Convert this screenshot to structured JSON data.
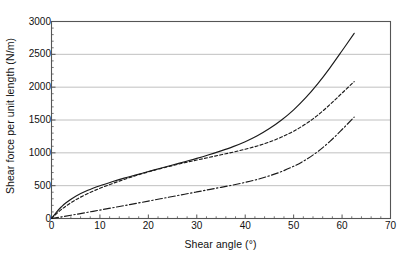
{
  "chart_data": {
    "type": "line",
    "title": "",
    "xlabel": "Shear angle (°)",
    "ylabel": "Shear force per unit length (N/m)",
    "xlim": [
      0,
      70
    ],
    "ylim": [
      0,
      3000
    ],
    "xticks": [
      0,
      10,
      20,
      30,
      40,
      50,
      60,
      70
    ],
    "yticks": [
      0,
      500,
      1000,
      1500,
      2000,
      2500,
      3000
    ],
    "xtick_labels": [
      "0",
      "10",
      "20",
      "30",
      "40",
      "50",
      "60",
      "70"
    ],
    "ytick_labels": [
      "0",
      "500",
      "1000",
      "1500",
      "2000",
      "2500",
      "3000"
    ],
    "grid": "horizontal",
    "grid_color": "#b9b9b9",
    "axis_color": "#555555",
    "legend": "none",
    "series": [
      {
        "name": "curve-solid",
        "style": "solid",
        "color": "#1a1a1a",
        "x": [
          0,
          1,
          2,
          3,
          5,
          7.5,
          10,
          12.5,
          15,
          17.5,
          20,
          22.5,
          25,
          27.5,
          30,
          32.5,
          35,
          37.5,
          40,
          42.5,
          45,
          47.5,
          50,
          52.5,
          55,
          57.5,
          60,
          62.5
        ],
        "y": [
          0,
          95,
          175,
          240,
          340,
          430,
          500,
          560,
          615,
          665,
          715,
          765,
          815,
          865,
          915,
          970,
          1030,
          1095,
          1170,
          1260,
          1370,
          1500,
          1655,
          1840,
          2055,
          2295,
          2555,
          2820
        ]
      },
      {
        "name": "curve-dashed",
        "style": "dashed",
        "color": "#1a1a1a",
        "x": [
          0,
          1,
          2,
          3,
          5,
          7.5,
          10,
          12.5,
          15,
          17.5,
          20,
          22.5,
          25,
          27.5,
          30,
          32.5,
          35,
          37.5,
          40,
          42.5,
          45,
          47.5,
          50,
          52.5,
          55,
          57.5,
          60,
          62.5
        ],
        "y": [
          0,
          70,
          135,
          190,
          285,
          380,
          460,
          530,
          595,
          655,
          710,
          760,
          805,
          850,
          890,
          930,
          970,
          1010,
          1055,
          1105,
          1165,
          1240,
          1330,
          1440,
          1575,
          1735,
          1910,
          2085
        ]
      },
      {
        "name": "curve-dash-dot",
        "style": "dash-dot",
        "color": "#1a1a1a",
        "x": [
          0,
          2.5,
          5,
          7.5,
          10,
          12.5,
          15,
          17.5,
          20,
          22.5,
          25,
          27.5,
          30,
          32.5,
          35,
          37.5,
          40,
          42.5,
          45,
          47.5,
          50,
          52.5,
          55,
          57.5,
          60,
          62.5
        ],
        "y": [
          0,
          30,
          62,
          95,
          128,
          162,
          196,
          230,
          265,
          300,
          335,
          370,
          405,
          440,
          475,
          510,
          550,
          595,
          650,
          715,
          795,
          895,
          1020,
          1175,
          1355,
          1545
        ]
      }
    ]
  }
}
